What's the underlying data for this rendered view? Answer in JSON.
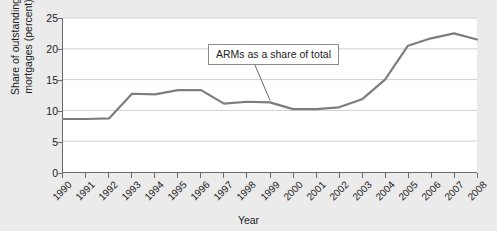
{
  "chart_data": {
    "type": "line",
    "title": "",
    "xlabel": "Year",
    "ylabel": "Share of outstanding mortgages (percent)",
    "ylabel_line1": "Share of outstanding",
    "ylabel_line2": "mortgages (percent)",
    "grid": true,
    "legend": "none",
    "xlim": [
      1990,
      2008
    ],
    "ylim": [
      0,
      25
    ],
    "yticks": [
      0,
      5,
      10,
      15,
      20,
      25
    ],
    "ytick_labels": [
      "0",
      "5",
      "10",
      "15",
      "20",
      "25"
    ],
    "categories": [
      "1990",
      "1991",
      "1992",
      "1993",
      "1994",
      "1995",
      "1996",
      "1997",
      "1998",
      "1999",
      "2000",
      "2001",
      "2002",
      "2003",
      "2004",
      "2005",
      "2006",
      "2007",
      "2008"
    ],
    "series": [
      {
        "name": "ARMs as a share of total",
        "color": "#7d7d7d",
        "values": [
          8.6,
          8.6,
          8.7,
          12.7,
          12.6,
          13.3,
          13.3,
          11.1,
          11.4,
          11.3,
          10.2,
          10.2,
          10.5,
          11.8,
          15.0,
          20.5,
          21.7,
          22.5,
          21.5
        ]
      }
    ],
    "annotations": [
      {
        "text": "ARMs as a share of total",
        "target_category": "1999",
        "target_value": 11.3
      }
    ]
  },
  "colors": {
    "page_background": "#ebebeb",
    "plot_background": "#ffffff",
    "axis": "#6b6b6b",
    "gridline": "#d0d0d0",
    "series_line": "#7d7d7d",
    "text": "#1c1c1c"
  }
}
